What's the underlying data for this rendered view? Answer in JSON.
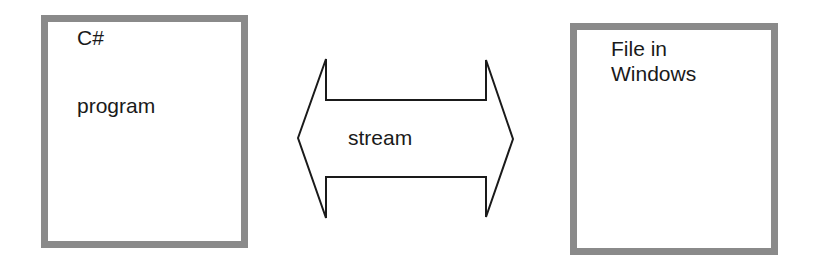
{
  "diagram": {
    "left_box": {
      "lines": [
        "C#",
        "program"
      ]
    },
    "right_box": {
      "lines": [
        "File in",
        "Windows"
      ]
    },
    "connector": {
      "type": "double-headed-arrow",
      "label": "stream"
    },
    "colors": {
      "box_border": "#8a8a8a",
      "arrow_stroke": "#1a1a1a",
      "text": "#1a1a1a",
      "background": "#ffffff"
    }
  }
}
